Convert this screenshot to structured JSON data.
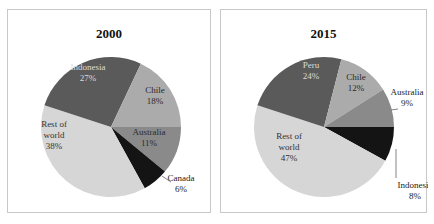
{
  "chart_data": [
    {
      "type": "pie",
      "title": "2000",
      "slices": [
        {
          "label": "Australia",
          "value": 11,
          "display": "11%",
          "color": "#8a8a8a",
          "text_color": "#2a2a2a"
        },
        {
          "label": "Canada",
          "value": 6,
          "display": "6%",
          "color": "#141414",
          "text_color": "#222222",
          "external": true
        },
        {
          "label": "Rest of world",
          "value": 38,
          "display": "38%",
          "color": "#d6d6d6",
          "text_color": "#333333"
        },
        {
          "label": "Indonesia",
          "value": 27,
          "display": "27%",
          "color": "#5a5a5a",
          "text_color": "#dcdcdc"
        },
        {
          "label": "Chile",
          "value": 18,
          "display": "18%",
          "color": "#ababab",
          "text_color": "#2a2a2a"
        }
      ],
      "start_angle_deg_from_top": 90,
      "direction": "clockwise"
    },
    {
      "type": "pie",
      "title": "2015",
      "slices": [
        {
          "label": "Indonesia",
          "value": 8,
          "display": "8%",
          "color": "#141414",
          "text_color": "#222222",
          "external": true
        },
        {
          "label": "Rest of world",
          "value": 47,
          "display": "47%",
          "color": "#d6d6d6",
          "text_color": "#333333"
        },
        {
          "label": "Peru",
          "value": 24,
          "display": "24%",
          "color": "#5a5a5a",
          "text_color": "#dcdcdc"
        },
        {
          "label": "Chile",
          "value": 12,
          "display": "12%",
          "color": "#ababab",
          "text_color": "#2a2a2a"
        },
        {
          "label": "Australia",
          "value": 9,
          "display": "9%",
          "color": "#8a8a8a",
          "text_color": "#222222",
          "external": true
        }
      ],
      "start_angle_deg_from_top": 90,
      "direction": "clockwise"
    }
  ],
  "panels": [
    {
      "title": "2000"
    },
    {
      "title": "2015"
    }
  ]
}
